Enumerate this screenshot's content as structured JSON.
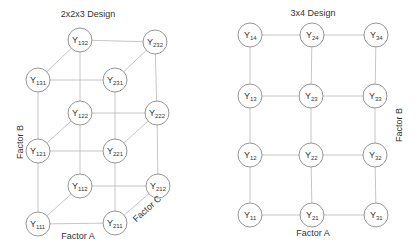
{
  "left_diagram": {
    "title": "2x2x3 Design",
    "axis_labels": {
      "factor_a": "Factor A",
      "factor_b": "Factor B",
      "factor_c": "Factor C"
    },
    "nodes": [
      {
        "id": "132",
        "base": "Y",
        "sub": "132",
        "x": 80,
        "y": 40
      },
      {
        "id": "232",
        "base": "Y",
        "sub": "232",
        "x": 155,
        "y": 42
      },
      {
        "id": "131",
        "base": "Y",
        "sub": "131",
        "x": 38,
        "y": 80
      },
      {
        "id": "231",
        "base": "Y",
        "sub": "231",
        "x": 115,
        "y": 80
      },
      {
        "id": "122",
        "base": "Y",
        "sub": "122",
        "x": 80,
        "y": 113
      },
      {
        "id": "222",
        "base": "Y",
        "sub": "222",
        "x": 157,
        "y": 113
      },
      {
        "id": "121",
        "base": "Y",
        "sub": "121",
        "x": 38,
        "y": 151
      },
      {
        "id": "221",
        "base": "Y",
        "sub": "221",
        "x": 115,
        "y": 151
      },
      {
        "id": "112",
        "base": "Y",
        "sub": "112",
        "x": 80,
        "y": 186
      },
      {
        "id": "212",
        "base": "Y",
        "sub": "212",
        "x": 158,
        "y": 186
      },
      {
        "id": "111",
        "base": "Y",
        "sub": "111",
        "x": 38,
        "y": 224
      },
      {
        "id": "211",
        "base": "Y",
        "sub": "211",
        "x": 115,
        "y": 223
      }
    ],
    "edges": [
      [
        "132",
        "232"
      ],
      [
        "131",
        "231"
      ],
      [
        "132",
        "131"
      ],
      [
        "232",
        "231"
      ],
      [
        "122",
        "222"
      ],
      [
        "121",
        "221"
      ],
      [
        "122",
        "121"
      ],
      [
        "222",
        "221"
      ],
      [
        "112",
        "212"
      ],
      [
        "111",
        "211"
      ],
      [
        "112",
        "111"
      ],
      [
        "212",
        "211"
      ],
      [
        "131",
        "121"
      ],
      [
        "121",
        "111"
      ],
      [
        "231",
        "221"
      ],
      [
        "221",
        "211"
      ],
      [
        "132",
        "122"
      ],
      [
        "122",
        "112"
      ],
      [
        "232",
        "222"
      ],
      [
        "222",
        "212"
      ]
    ]
  },
  "right_diagram": {
    "title": "3x4 Design",
    "axis_labels": {
      "factor_a": "Factor A",
      "factor_b": "Factor B"
    },
    "nodes": [
      {
        "id": "14",
        "base": "Y",
        "sub": "14",
        "x": 250,
        "y": 35
      },
      {
        "id": "24",
        "base": "Y",
        "sub": "24",
        "x": 312,
        "y": 35
      },
      {
        "id": "34",
        "base": "Y",
        "sub": "34",
        "x": 376,
        "y": 35
      },
      {
        "id": "13",
        "base": "Y",
        "sub": "13",
        "x": 250,
        "y": 96
      },
      {
        "id": "23",
        "base": "Y",
        "sub": "23",
        "x": 311,
        "y": 96
      },
      {
        "id": "33",
        "base": "Y",
        "sub": "33",
        "x": 375,
        "y": 96
      },
      {
        "id": "12",
        "base": "Y",
        "sub": "12",
        "x": 250,
        "y": 155
      },
      {
        "id": "22",
        "base": "Y",
        "sub": "22",
        "x": 311,
        "y": 155
      },
      {
        "id": "32",
        "base": "Y",
        "sub": "32",
        "x": 375,
        "y": 155
      },
      {
        "id": "11",
        "base": "Y",
        "sub": "11",
        "x": 250,
        "y": 215
      },
      {
        "id": "21",
        "base": "Y",
        "sub": "21",
        "x": 312,
        "y": 215
      },
      {
        "id": "31",
        "base": "Y",
        "sub": "31",
        "x": 376,
        "y": 215
      }
    ],
    "edges": [
      [
        "14",
        "24"
      ],
      [
        "24",
        "34"
      ],
      [
        "13",
        "23"
      ],
      [
        "23",
        "33"
      ],
      [
        "12",
        "22"
      ],
      [
        "22",
        "32"
      ],
      [
        "11",
        "21"
      ],
      [
        "21",
        "31"
      ],
      [
        "14",
        "13"
      ],
      [
        "13",
        "12"
      ],
      [
        "12",
        "11"
      ],
      [
        "24",
        "23"
      ],
      [
        "23",
        "22"
      ],
      [
        "22",
        "21"
      ],
      [
        "34",
        "33"
      ],
      [
        "33",
        "32"
      ],
      [
        "32",
        "31"
      ]
    ]
  },
  "style": {
    "node_radius": 12,
    "edge_color": "#b8b8b8",
    "node_stroke": "#8a8a8a",
    "text_color": "#333333"
  }
}
